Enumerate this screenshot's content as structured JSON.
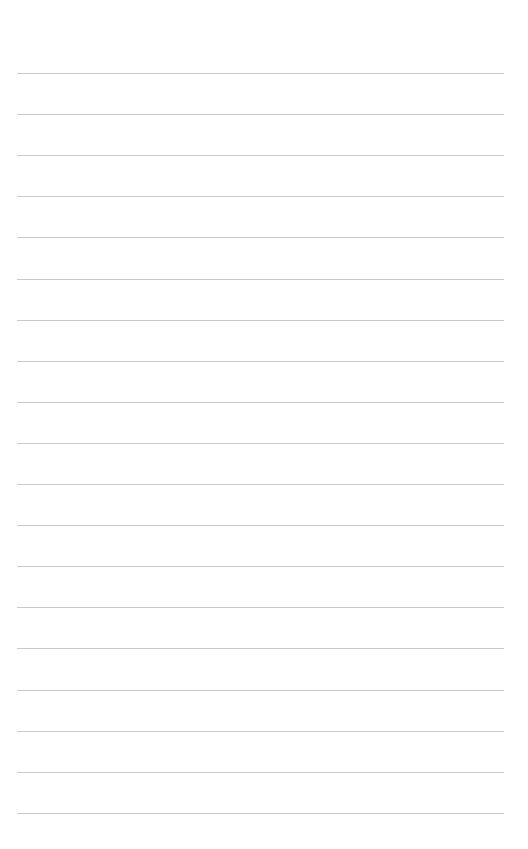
{
  "page": {
    "type": "lined-paper",
    "background_color": "#ffffff",
    "line_color": "#c9c9c9",
    "line_count": 19,
    "first_line_y": 73,
    "line_spacing": 41.1,
    "line_left": 17,
    "line_right": 504,
    "lines": [
      {
        "text": ""
      },
      {
        "text": ""
      },
      {
        "text": ""
      },
      {
        "text": ""
      },
      {
        "text": ""
      },
      {
        "text": ""
      },
      {
        "text": ""
      },
      {
        "text": ""
      },
      {
        "text": ""
      },
      {
        "text": ""
      },
      {
        "text": ""
      },
      {
        "text": ""
      },
      {
        "text": ""
      },
      {
        "text": ""
      },
      {
        "text": ""
      },
      {
        "text": ""
      },
      {
        "text": ""
      },
      {
        "text": ""
      },
      {
        "text": ""
      }
    ]
  }
}
